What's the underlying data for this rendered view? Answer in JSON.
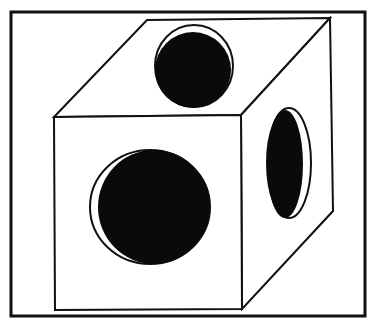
{
  "figure": {
    "colors": {
      "background": "#ffffff",
      "line": "#111111",
      "fill": "#0a0a0a"
    },
    "frame": {
      "x": 11,
      "y": 12,
      "w": 354,
      "h": 304
    },
    "cube": {
      "front_face": "54,117 241,115 242,309 55,310",
      "top_face": "54,117 147,20 330,18 241,115",
      "right_face": "241,115 330,18 333,211 242,309"
    },
    "holes": [
      {
        "name": "top-hole",
        "outline": {
          "cx": 194,
          "cy": 66,
          "rx": 39,
          "ry": 41
        },
        "fill": {
          "cx": 193,
          "cy": 70,
          "rx": 38,
          "ry": 38
        }
      },
      {
        "name": "front-hole",
        "outline": {
          "cx": 150,
          "cy": 207,
          "rx": 60,
          "ry": 57
        },
        "fill": {
          "cx": 154,
          "cy": 207,
          "rx": 56,
          "ry": 57
        }
      },
      {
        "name": "right-hole",
        "outline": {
          "cx": 289,
          "cy": 163,
          "rx": 22,
          "ry": 55
        },
        "fill": {
          "cx": 285,
          "cy": 164,
          "rx": 18,
          "ry": 54
        }
      }
    ]
  }
}
